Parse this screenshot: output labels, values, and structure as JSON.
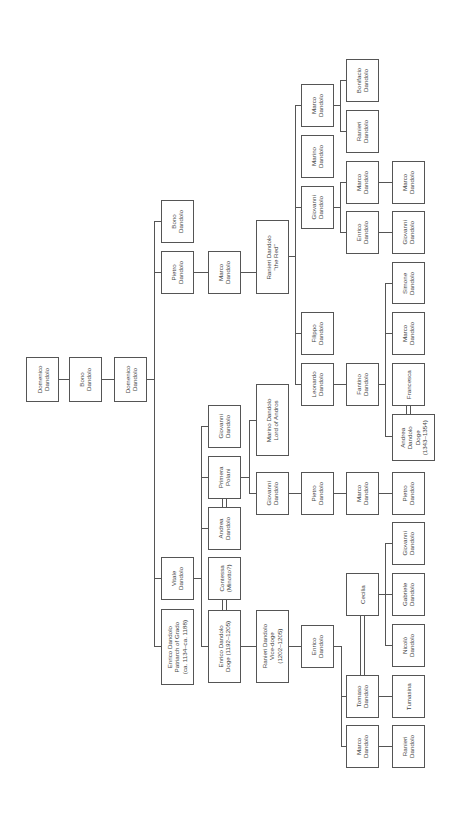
{
  "diagram": {
    "type": "family-tree",
    "orientation": "rotated-90-ccw",
    "family": "Dandolo",
    "people": [
      {
        "id": "domenico1",
        "label": "Domenico\nDandolo",
        "x": 26,
        "y": 357,
        "w": 33,
        "h": 45
      },
      {
        "id": "bono1",
        "label": "Bono\nDandolo",
        "x": 69,
        "y": 357,
        "w": 33,
        "h": 45
      },
      {
        "id": "domenico2",
        "label": "Domenico\nDandolo",
        "x": 114,
        "y": 357,
        "w": 33,
        "h": 45
      },
      {
        "id": "bono2",
        "label": "Bono\nDandolo",
        "x": 161,
        "y": 200,
        "w": 33,
        "h": 43
      },
      {
        "id": "pietro1",
        "label": "Pietro\nDandolo",
        "x": 161,
        "y": 251,
        "w": 33,
        "h": 43
      },
      {
        "id": "vitale",
        "label": "Vitale\nDandolo",
        "x": 161,
        "y": 557,
        "w": 33,
        "h": 43
      },
      {
        "id": "enrico_patriarch",
        "label": "Enrico Dandolo\nPatriarch of Grado\n(ca. 1134–ca. 1188)",
        "x": 161,
        "y": 609,
        "w": 33,
        "h": 76
      },
      {
        "id": "marco1",
        "label": "Marco\nDandolo",
        "x": 208,
        "y": 251,
        "w": 33,
        "h": 43
      },
      {
        "id": "giovanni1",
        "label": "Giovanni\nDandolo",
        "x": 208,
        "y": 405,
        "w": 33,
        "h": 43
      },
      {
        "id": "primera",
        "label": "Primera\nPolani",
        "x": 208,
        "y": 456,
        "w": 33,
        "h": 43
      },
      {
        "id": "andrea1",
        "label": "Andrea\nDandolo",
        "x": 208,
        "y": 507,
        "w": 33,
        "h": 43
      },
      {
        "id": "contessa",
        "label": "Contessa\n(Minotto?)",
        "x": 208,
        "y": 557,
        "w": 33,
        "h": 43
      },
      {
        "id": "enrico_doge",
        "label": "Enrico Dandolo\nDoge (1192–1205)",
        "x": 208,
        "y": 610,
        "w": 33,
        "h": 73
      },
      {
        "id": "ranieri_red",
        "label": "Ranieri Dandolo\n\"the Red\"",
        "x": 256,
        "y": 220,
        "w": 33,
        "h": 74
      },
      {
        "id": "marino_andros",
        "label": "Marino Dandolo\nLord of Andros",
        "x": 256,
        "y": 384,
        "w": 33,
        "h": 72
      },
      {
        "id": "giovanni2",
        "label": "Giovanni\nDandolo",
        "x": 256,
        "y": 472,
        "w": 33,
        "h": 43
      },
      {
        "id": "ranieri_vicedoge",
        "label": "Ranieri Dandolo\nVice-doge\n(1202–1205)",
        "x": 256,
        "y": 610,
        "w": 33,
        "h": 73
      },
      {
        "id": "marco2",
        "label": "Marco\nDandolo",
        "x": 301,
        "y": 84,
        "w": 33,
        "h": 43
      },
      {
        "id": "marino2",
        "label": "Marino\nDandolo",
        "x": 301,
        "y": 135,
        "w": 33,
        "h": 43
      },
      {
        "id": "giovanni3",
        "label": "Giovanni\nDandolo",
        "x": 301,
        "y": 186,
        "w": 33,
        "h": 43
      },
      {
        "id": "filippo",
        "label": "Filippo\nDandolo",
        "x": 301,
        "y": 312,
        "w": 33,
        "h": 43
      },
      {
        "id": "leonardo",
        "label": "Leonardo\nDandolo",
        "x": 301,
        "y": 363,
        "w": 33,
        "h": 43
      },
      {
        "id": "pietro2",
        "label": "Pietro\nDandolo",
        "x": 301,
        "y": 472,
        "w": 33,
        "h": 43
      },
      {
        "id": "enrico3",
        "label": "Enrico\nDandolo",
        "x": 301,
        "y": 625,
        "w": 33,
        "h": 43
      },
      {
        "id": "ranieri3",
        "label": "Ranieri\nDandolo",
        "x": 346,
        "y": 110,
        "w": 33,
        "h": 43
      },
      {
        "id": "bonifacio",
        "label": "Bonifacio\nDandolo",
        "x": 346,
        "y": 59,
        "w": 33,
        "h": 43
      },
      {
        "id": "marco3",
        "label": "Marco\nDandolo",
        "x": 346,
        "y": 161,
        "w": 33,
        "h": 43
      },
      {
        "id": "enrico4",
        "label": "Enrico\nDandolo",
        "x": 346,
        "y": 211,
        "w": 33,
        "h": 43
      },
      {
        "id": "fantino",
        "label": "Fantino\nDandolo",
        "x": 346,
        "y": 363,
        "w": 33,
        "h": 43
      },
      {
        "id": "marco4",
        "label": "Marco\nDandolo",
        "x": 346,
        "y": 472,
        "w": 33,
        "h": 43
      },
      {
        "id": "cecilia",
        "label": "Cecilia",
        "x": 346,
        "y": 573,
        "w": 33,
        "h": 43
      },
      {
        "id": "tomaso",
        "label": "Tomaso\nDandolo",
        "x": 346,
        "y": 675,
        "w": 33,
        "h": 43
      },
      {
        "id": "marco5",
        "label": "Marco\nDandolo",
        "x": 346,
        "y": 725,
        "w": 33,
        "h": 43
      },
      {
        "id": "marco6",
        "label": "Marco\nDandolo",
        "x": 392,
        "y": 161,
        "w": 33,
        "h": 43
      },
      {
        "id": "giovanni4",
        "label": "Giovanni\nDandolo",
        "x": 392,
        "y": 211,
        "w": 33,
        "h": 43
      },
      {
        "id": "simone",
        "label": "Simone\nDandolo",
        "x": 392,
        "y": 262,
        "w": 33,
        "h": 42
      },
      {
        "id": "marco7",
        "label": "Marco\nDandolo",
        "x": 392,
        "y": 312,
        "w": 33,
        "h": 43
      },
      {
        "id": "francesca",
        "label": "Francesca",
        "x": 392,
        "y": 363,
        "w": 33,
        "h": 43
      },
      {
        "id": "andrea_doge",
        "label": "Andrea\nDandolo\nDoge\n(1343–1354)",
        "x": 392,
        "y": 414,
        "w": 43,
        "h": 47
      },
      {
        "id": "pietro3",
        "label": "Pietro\nDandolo",
        "x": 392,
        "y": 472,
        "w": 33,
        "h": 43
      },
      {
        "id": "giovanni5",
        "label": "Giovanni\nDandolo",
        "x": 392,
        "y": 522,
        "w": 33,
        "h": 43
      },
      {
        "id": "gabriele",
        "label": "Gabriele\nDandolo",
        "x": 392,
        "y": 573,
        "w": 33,
        "h": 43
      },
      {
        "id": "nicolo",
        "label": "Nicolò\nDandolo",
        "x": 392,
        "y": 624,
        "w": 33,
        "h": 43
      },
      {
        "id": "tumasina",
        "label": "Tumasina",
        "x": 392,
        "y": 675,
        "w": 33,
        "h": 43
      },
      {
        "id": "ranieri4",
        "label": "Ranieri\nDandolo",
        "x": 392,
        "y": 725,
        "w": 33,
        "h": 43
      }
    ],
    "lines": [
      {
        "x": 59,
        "y": 379,
        "w": 10,
        "h": 1
      },
      {
        "x": 102,
        "y": 379,
        "w": 12,
        "h": 1
      },
      {
        "x": 147,
        "y": 379,
        "w": 7,
        "h": 1
      },
      {
        "x": 154,
        "y": 221,
        "w": 1,
        "h": 426
      },
      {
        "x": 154,
        "y": 221,
        "w": 7,
        "h": 1
      },
      {
        "x": 154,
        "y": 272,
        "w": 7,
        "h": 1
      },
      {
        "x": 154,
        "y": 578,
        "w": 7,
        "h": 1
      },
      {
        "x": 154,
        "y": 646,
        "w": 7,
        "h": 1
      },
      {
        "x": 194,
        "y": 272,
        "w": 14,
        "h": 1
      },
      {
        "x": 241,
        "y": 272,
        "w": 15,
        "h": 1
      },
      {
        "x": 194,
        "y": 578,
        "w": 7,
        "h": 1
      },
      {
        "x": 201,
        "y": 426,
        "w": 1,
        "h": 221
      },
      {
        "x": 201,
        "y": 426,
        "w": 7,
        "h": 1
      },
      {
        "x": 201,
        "y": 477,
        "w": 7,
        "h": 1
      },
      {
        "x": 201,
        "y": 528,
        "w": 7,
        "h": 1
      },
      {
        "x": 201,
        "y": 646,
        "w": 7,
        "h": 1
      },
      {
        "x": 222,
        "y": 499,
        "w": 1,
        "h": 8
      },
      {
        "x": 226,
        "y": 499,
        "w": 1,
        "h": 8
      },
      {
        "x": 222,
        "y": 600,
        "w": 1,
        "h": 10
      },
      {
        "x": 226,
        "y": 600,
        "w": 1,
        "h": 10
      },
      {
        "x": 241,
        "y": 477,
        "w": 8,
        "h": 1
      },
      {
        "x": 249,
        "y": 420,
        "w": 1,
        "h": 74
      },
      {
        "x": 249,
        "y": 420,
        "w": 7,
        "h": 1
      },
      {
        "x": 249,
        "y": 493,
        "w": 7,
        "h": 1
      },
      {
        "x": 241,
        "y": 646,
        "w": 15,
        "h": 1
      },
      {
        "x": 289,
        "y": 646,
        "w": 12,
        "h": 1
      },
      {
        "x": 289,
        "y": 256,
        "w": 6,
        "h": 1
      },
      {
        "x": 295,
        "y": 105,
        "w": 1,
        "h": 279
      },
      {
        "x": 295,
        "y": 105,
        "w": 6,
        "h": 1
      },
      {
        "x": 295,
        "y": 207,
        "w": 6,
        "h": 1
      },
      {
        "x": 295,
        "y": 333,
        "w": 6,
        "h": 1
      },
      {
        "x": 295,
        "y": 384,
        "w": 6,
        "h": 1
      },
      {
        "x": 289,
        "y": 493,
        "w": 12,
        "h": 1
      },
      {
        "x": 334,
        "y": 493,
        "w": 12,
        "h": 1
      },
      {
        "x": 379,
        "y": 493,
        "w": 13,
        "h": 1
      },
      {
        "x": 334,
        "y": 105,
        "w": 6,
        "h": 1
      },
      {
        "x": 340,
        "y": 80,
        "w": 1,
        "h": 52
      },
      {
        "x": 340,
        "y": 80,
        "w": 6,
        "h": 1
      },
      {
        "x": 340,
        "y": 131,
        "w": 6,
        "h": 1
      },
      {
        "x": 334,
        "y": 207,
        "w": 6,
        "h": 1
      },
      {
        "x": 340,
        "y": 182,
        "w": 1,
        "h": 51
      },
      {
        "x": 340,
        "y": 182,
        "w": 6,
        "h": 1
      },
      {
        "x": 340,
        "y": 232,
        "w": 6,
        "h": 1
      },
      {
        "x": 379,
        "y": 182,
        "w": 13,
        "h": 1
      },
      {
        "x": 379,
        "y": 232,
        "w": 13,
        "h": 1
      },
      {
        "x": 334,
        "y": 384,
        "w": 12,
        "h": 1
      },
      {
        "x": 379,
        "y": 384,
        "w": 6,
        "h": 1
      },
      {
        "x": 385,
        "y": 283,
        "w": 1,
        "h": 154
      },
      {
        "x": 385,
        "y": 283,
        "w": 7,
        "h": 1
      },
      {
        "x": 385,
        "y": 333,
        "w": 7,
        "h": 1
      },
      {
        "x": 385,
        "y": 436,
        "w": 7,
        "h": 1
      },
      {
        "x": 406,
        "y": 406,
        "w": 1,
        "h": 8
      },
      {
        "x": 410,
        "y": 406,
        "w": 1,
        "h": 8
      },
      {
        "x": 334,
        "y": 646,
        "w": 7,
        "h": 1
      },
      {
        "x": 341,
        "y": 646,
        "w": 1,
        "h": 101
      },
      {
        "x": 341,
        "y": 696,
        "w": 5,
        "h": 1
      },
      {
        "x": 341,
        "y": 746,
        "w": 5,
        "h": 1
      },
      {
        "x": 379,
        "y": 696,
        "w": 13,
        "h": 1
      },
      {
        "x": 379,
        "y": 746,
        "w": 13,
        "h": 1
      },
      {
        "x": 360,
        "y": 616,
        "w": 1,
        "h": 59
      },
      {
        "x": 364,
        "y": 616,
        "w": 1,
        "h": 59
      },
      {
        "x": 379,
        "y": 594,
        "w": 6,
        "h": 1
      },
      {
        "x": 385,
        "y": 543,
        "w": 1,
        "h": 102
      },
      {
        "x": 385,
        "y": 543,
        "w": 7,
        "h": 1
      },
      {
        "x": 385,
        "y": 594,
        "w": 7,
        "h": 1
      },
      {
        "x": 385,
        "y": 645,
        "w": 7,
        "h": 1
      }
    ]
  }
}
